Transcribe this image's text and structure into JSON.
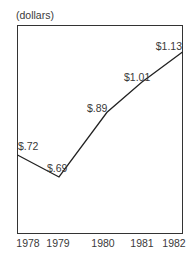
{
  "chart_data": {
    "type": "line",
    "title": "",
    "ylabel": "(dollars)",
    "xlabel": "",
    "categories": [
      "1978",
      "1979",
      "1980",
      "1981",
      "1982"
    ],
    "x": [
      1978,
      1979,
      1980,
      1981,
      1982
    ],
    "values": [
      0.72,
      0.69,
      0.89,
      1.01,
      1.13
    ],
    "data_labels": [
      "$.72",
      "$.69",
      "$.89",
      "$1.01",
      "$1.13"
    ],
    "grid": false,
    "legend": null
  },
  "ui": {
    "unit_label": "(dollars)",
    "line_color": "#222222",
    "frame_color": "#333333"
  }
}
